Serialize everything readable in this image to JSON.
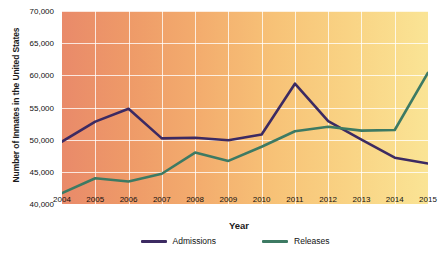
{
  "chart_data": {
    "type": "line",
    "title": "",
    "xlabel": "Year",
    "ylabel": "Number of Inmates in the United States",
    "x": [
      2004,
      2005,
      2006,
      2007,
      2008,
      2009,
      2010,
      2011,
      2012,
      2013,
      2014,
      2015
    ],
    "categories": [
      "2004",
      "2005",
      "2006",
      "2007",
      "2008",
      "2009",
      "2010",
      "2011",
      "2012",
      "2013",
      "2014",
      "2015"
    ],
    "xlim": [
      2004,
      2015
    ],
    "ylim": [
      40000,
      70000
    ],
    "y_ticks": [
      40000,
      45000,
      50000,
      55000,
      60000,
      65000,
      70000
    ],
    "y_tick_labels": [
      "40,000",
      "45,000",
      "50,000",
      "55,000",
      "60,000",
      "65,000",
      "70,000"
    ],
    "grid": true,
    "legend_position": "bottom",
    "series": [
      {
        "name": "Admissions",
        "color": "#3c2a62",
        "values": [
          49700,
          52800,
          54800,
          50200,
          50300,
          49900,
          50800,
          58700,
          52900,
          50000,
          47200,
          46300
        ]
      },
      {
        "name": "Releases",
        "color": "#3d7a63",
        "values": [
          41700,
          44000,
          43500,
          44700,
          48000,
          46700,
          48900,
          51300,
          52000,
          51400,
          51500,
          60400
        ]
      }
    ],
    "background_gradient": {
      "from": "#e98a6a",
      "to": "#fae495",
      "direction": "left-to-right"
    },
    "gridline_color": "#ffffff"
  },
  "legend": {
    "items": [
      {
        "label": "Admissions",
        "color": "#3c2a62"
      },
      {
        "label": "Releases",
        "color": "#3d7a63"
      }
    ]
  },
  "axes": {
    "y_title": "Number of Inmates in the United States",
    "x_title": "Year"
  }
}
